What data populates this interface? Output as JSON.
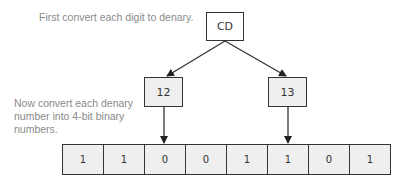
{
  "captions": {
    "step1": "First convert each digit to denary.",
    "step2": "Now convert each denary number into 4-bit binary numbers."
  },
  "root": {
    "label": "CD"
  },
  "denary": [
    {
      "label": "12"
    },
    {
      "label": "13"
    }
  ],
  "binary": {
    "bits": [
      "1",
      "1",
      "0",
      "0",
      "1",
      "1",
      "0",
      "1"
    ]
  },
  "colors": {
    "box_fill": "#efefef",
    "stroke": "#333333",
    "caption_text": "#8a8a8a"
  }
}
